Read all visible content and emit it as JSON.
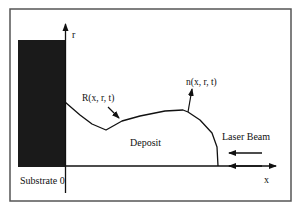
{
  "diagram": {
    "labels": {
      "r_axis": "r",
      "x_axis": "x",
      "surface": "R(x, r, t)",
      "normal": "n(x, r, t)",
      "deposit": "Deposit",
      "laser": "Laser Beam",
      "substrate": "Substrate 0"
    },
    "colors": {
      "frame": "#555555",
      "ink": "#111111",
      "substrate_fill": "#1a1a1a"
    }
  }
}
